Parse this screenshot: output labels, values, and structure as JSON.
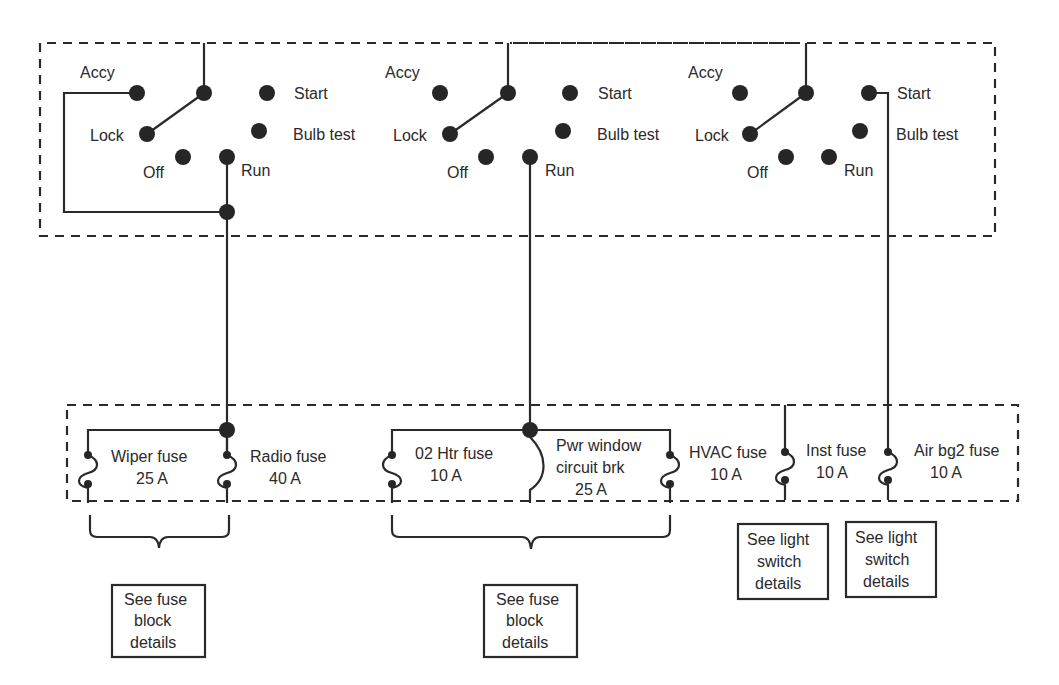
{
  "diagram": {
    "title": "",
    "ignition_switch_box": {
      "switches": [
        {
          "id": "switch-1",
          "positions": {
            "accy": "Accy",
            "start": "Start",
            "lock": "Lock",
            "bulb_test": "Bulb test",
            "off": "Off",
            "run": "Run"
          },
          "wired_positions": [
            "Accy",
            "Run"
          ]
        },
        {
          "id": "switch-2",
          "positions": {
            "accy": "Accy",
            "start": "Start",
            "lock": "Lock",
            "bulb_test": "Bulb test",
            "off": "Off",
            "run": "Run"
          },
          "wired_positions": [
            "Run"
          ]
        },
        {
          "id": "switch-3",
          "positions": {
            "accy": "Accy",
            "start": "Start",
            "lock": "Lock",
            "bulb_test": "Bulb test",
            "off": "Off",
            "run": "Run"
          },
          "wired_positions": [
            "Start"
          ]
        }
      ]
    },
    "fuse_block": {
      "fuses": [
        {
          "name": "Wiper fuse",
          "rating": "25 A"
        },
        {
          "name": "Radio fuse",
          "rating": "40 A"
        },
        {
          "name": "02 Htr fuse",
          "rating": "10 A"
        },
        {
          "name_line1": "Pwr window",
          "name_line2": "circuit brk",
          "rating": "25 A"
        },
        {
          "name": "HVAC fuse",
          "rating": "10 A"
        },
        {
          "name": "Inst fuse",
          "rating": "10 A"
        },
        {
          "name": "Air bg2 fuse",
          "rating": "10 A"
        }
      ]
    },
    "reference_boxes": [
      {
        "line1": "See fuse",
        "line2": "block",
        "line3": "details"
      },
      {
        "line1": "See fuse",
        "line2": "block",
        "line3": "details"
      },
      {
        "line1": "See light",
        "line2": "switch",
        "line3": "details"
      },
      {
        "line1": "See light",
        "line2": "switch",
        "line3": "details"
      }
    ],
    "colors": {
      "ink": "#2a2a2a",
      "background": "#ffffff"
    }
  }
}
